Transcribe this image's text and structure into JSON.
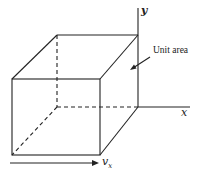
{
  "diagram": {
    "title": "",
    "labels": {
      "y_axis": "y",
      "x_axis": "x",
      "unit_area": "Unit area",
      "velocity": "v",
      "velocity_sub": "x"
    },
    "colors": {
      "stroke": "#222222",
      "background": "#ffffff"
    },
    "shapes": {
      "cube_front_face": {
        "x1": 12,
        "y1": 79,
        "x2": 100,
        "y2": 155
      },
      "cube_back_face": {
        "x1": 57,
        "y1": 35,
        "x2": 138,
        "y2": 107
      },
      "hidden_edges": "dashed"
    }
  }
}
